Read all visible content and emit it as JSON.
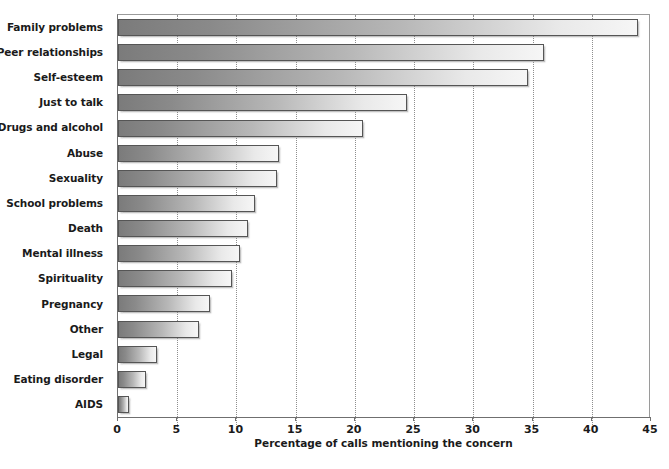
{
  "chart_data": {
    "type": "bar",
    "orientation": "horizontal",
    "title": "",
    "xlabel": "Percentage of calls mentioning the concern",
    "ylabel": "",
    "xlim": [
      0,
      45
    ],
    "xticks": [
      0,
      5,
      10,
      15,
      20,
      25,
      30,
      35,
      40,
      45
    ],
    "grid": "vertical-dotted",
    "legend": "none",
    "bar_style": {
      "gradient_start": "#7b7b7b",
      "gradient_end": "#f6f6f6",
      "border": "#555555"
    },
    "categories": [
      "Family problems",
      "Peer relationships",
      "Self-esteem",
      "Just to talk",
      "Drugs and alcohol",
      "Abuse",
      "Sexuality",
      "School problems",
      "Death",
      "Mental illness",
      "Spirituality",
      "Pregnancy",
      "Other",
      "Legal",
      "Eating disorder",
      "AIDS"
    ],
    "values": [
      43.9,
      36.0,
      34.6,
      24.4,
      20.7,
      13.6,
      13.4,
      11.6,
      11.0,
      10.3,
      9.6,
      7.8,
      6.8,
      3.3,
      2.4,
      0.9
    ]
  }
}
